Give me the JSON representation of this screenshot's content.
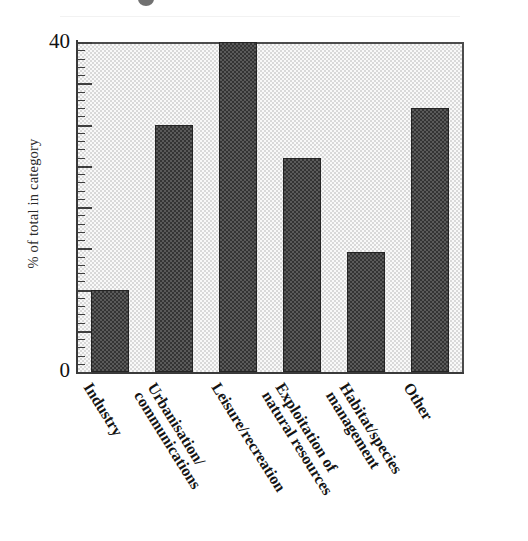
{
  "figure": {
    "title": "",
    "y_axis_title": "% of total in category",
    "y_tick_top_label": "40",
    "y_tick_bottom_label": "0"
  },
  "chart_data": {
    "type": "bar",
    "title": "",
    "xlabel": "",
    "ylabel": "% of total in category",
    "ylim": [
      0,
      40
    ],
    "ytick_labels": [
      "0",
      "40"
    ],
    "ytick_values": [
      0,
      40
    ],
    "grid": false,
    "legend": null,
    "categories": [
      "Industry",
      "Urbanisation/ communications",
      "Leisure/recreation",
      "Exploitation of natural resources",
      "Habitat/species management",
      "Other"
    ],
    "values": [
      10,
      30,
      40,
      26,
      14.5,
      32
    ],
    "bar_color": "#5a5a5a",
    "bar_edge_color": "#242424",
    "plot_background_color": "#d9d9d9"
  },
  "categories": [
    {
      "line1": "Industry",
      "line2": ""
    },
    {
      "line1": "Urbanisation/",
      "line2": "communications"
    },
    {
      "line1": "Leisure/recreation",
      "line2": ""
    },
    {
      "line1": "Exploitation of",
      "line2": "natural resources"
    },
    {
      "line1": "Habitat/species",
      "line2": "management"
    },
    {
      "line1": "Other",
      "line2": ""
    }
  ]
}
